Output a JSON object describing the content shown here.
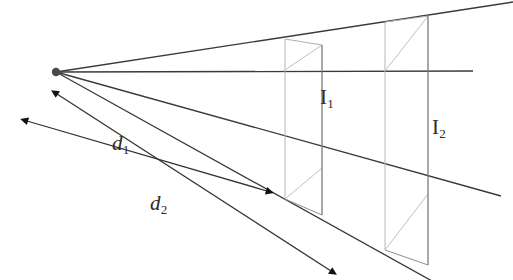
{
  "figure": {
    "kind": "perspective-ray-diagram",
    "background_color": "#ffffff",
    "ray_color": "#3a3a3a",
    "plane_edge_color": "#9a9a9a",
    "arrow_color": "#111111",
    "source_point_color": "#4a4a4a"
  },
  "labels": {
    "d1": {
      "base": "d",
      "sub": "1",
      "text": "d1"
    },
    "d2": {
      "base": "d",
      "sub": "2",
      "text": "d2"
    },
    "I1": {
      "base": "I",
      "sub": "1",
      "text": "I1"
    },
    "I2": {
      "base": "I",
      "sub": "2",
      "text": "I2"
    }
  },
  "geometry": {
    "source_point": {
      "x": 56,
      "y": 72,
      "radius": 4
    },
    "rays": [
      {
        "name": "upper-ray",
        "x1": 56,
        "y1": 72,
        "x2": 513,
        "y2": 2
      },
      {
        "name": "axis-ray",
        "x1": 56,
        "y1": 72,
        "x2": 473,
        "y2": 71
      },
      {
        "name": "lower-ray",
        "x1": 56,
        "y1": 72,
        "x2": 501,
        "y2": 196
      },
      {
        "name": "bottom-ray",
        "x1": 56,
        "y1": 72,
        "x2": 430,
        "y2": 280
      }
    ],
    "plane1": {
      "top_left": {
        "x": 285,
        "y": 39
      },
      "top_right": {
        "x": 322,
        "y": 45
      },
      "front_top_left": {
        "x": 285,
        "y": 70
      },
      "front_top_right": {
        "x": 322,
        "y": 70
      },
      "front_bottom_left": {
        "x": 285,
        "y": 155
      },
      "front_bottom_right": {
        "x": 322,
        "y": 168
      },
      "bottom_left": {
        "x": 285,
        "y": 199
      },
      "bottom_right": {
        "x": 322,
        "y": 215
      }
    },
    "plane2": {
      "top_left": {
        "x": 385,
        "y": 22
      },
      "top_right": {
        "x": 428,
        "y": 16
      },
      "front_top_left": {
        "x": 385,
        "y": 71
      },
      "front_top_right": {
        "x": 428,
        "y": 71
      },
      "front_bottom_left": {
        "x": 385,
        "y": 182
      },
      "front_bottom_right": {
        "x": 428,
        "y": 194
      },
      "bottom_left": {
        "x": 385,
        "y": 248
      },
      "bottom_right": {
        "x": 428,
        "y": 263
      }
    },
    "measure_d1": {
      "from": {
        "x": 26,
        "y": 120
      },
      "to": {
        "x": 268,
        "y": 192
      },
      "arrow_start": true,
      "arrow_end": true
    },
    "measure_d2": {
      "from": {
        "x": 56,
        "y": 93
      },
      "to": {
        "x": 332,
        "y": 272
      },
      "arrow_start": true,
      "arrow_end": true
    }
  }
}
